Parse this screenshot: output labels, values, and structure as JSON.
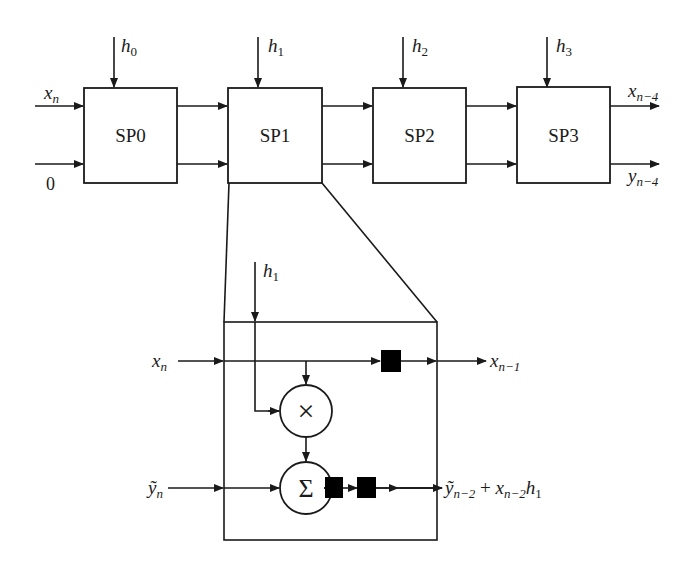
{
  "diagram": {
    "type": "systolic FIR filter block diagram",
    "top_chain": {
      "inputs": {
        "x": "x",
        "x_sub": "n",
        "y_init": "0"
      },
      "blocks": [
        {
          "label": "SP0",
          "coef": "h",
          "coef_sub": "0"
        },
        {
          "label": "SP1",
          "coef": "h",
          "coef_sub": "1"
        },
        {
          "label": "SP2",
          "coef": "h",
          "coef_sub": "2"
        },
        {
          "label": "SP3",
          "coef": "h",
          "coef_sub": "3"
        }
      ],
      "outputs": {
        "x": "x",
        "x_sub": "n−4",
        "y": "y",
        "y_sub": "n−4"
      }
    },
    "detail": {
      "of_block": "SP1",
      "coef": "h",
      "coef_sub": "1",
      "x_in": "x",
      "x_in_sub": "n",
      "x_out": "x",
      "x_out_sub": "n−1",
      "y_in": "ỹ",
      "y_in_sub": "n",
      "multiplier_symbol": "×",
      "adder_symbol": "Σ",
      "top_delays": 1,
      "bottom_delays": 2,
      "y_out": {
        "y": "ỹ",
        "y_sub": "n−2",
        "plus": " + ",
        "x": "x",
        "x_sub": "n−2",
        "h": "h",
        "h_sub": "1"
      }
    }
  }
}
